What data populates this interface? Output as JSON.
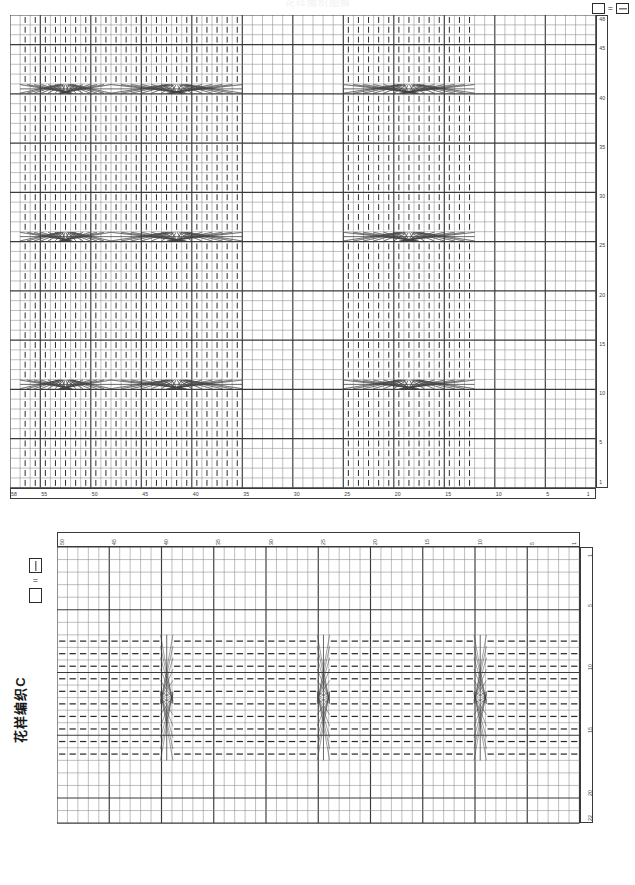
{
  "page": {
    "top_title": "花样编织图解"
  },
  "legend_a": {
    "name": "chart-a-legend",
    "empty_symbol": "square-empty",
    "equals": "=",
    "filled_symbol": "square-with-horizontal-dash"
  },
  "legend_b": {
    "name": "chart-b-legend",
    "bar_symbol": "square-with-vertical-bar",
    "equals": "=",
    "empty_symbol": "square-empty"
  },
  "chart_b_caption": "花样编织C",
  "chart_a": {
    "name": "pattern-chart-a",
    "cols": 58,
    "rows": 48,
    "cell_w": 10.1,
    "cell_h": 9.85,
    "origin_x": 10,
    "origin_y": 15,
    "heavy_every": 5,
    "direction": "right-to-left",
    "bottom_ticks": [
      {
        "label": "58",
        "col": 58
      },
      {
        "label": "55",
        "col": 55
      },
      {
        "label": "50",
        "col": 50
      },
      {
        "label": "45",
        "col": 45
      },
      {
        "label": "40",
        "col": 40
      },
      {
        "label": "35",
        "col": 35
      },
      {
        "label": "30",
        "col": 30
      },
      {
        "label": "25",
        "col": 25
      },
      {
        "label": "20",
        "col": 20
      },
      {
        "label": "15",
        "col": 15
      },
      {
        "label": "10",
        "col": 10
      },
      {
        "label": "5",
        "col": 5
      },
      {
        "label": "1",
        "col": 1
      }
    ],
    "right_ticks": [
      {
        "label": "48",
        "row": 48
      },
      {
        "label": "45",
        "row": 45
      },
      {
        "label": "40",
        "row": 40
      },
      {
        "label": "35",
        "row": 35
      },
      {
        "label": "30",
        "row": 30
      },
      {
        "label": "25",
        "row": 25
      },
      {
        "label": "20",
        "row": 20
      },
      {
        "label": "15",
        "row": 15
      },
      {
        "label": "10",
        "row": 10
      },
      {
        "label": "5",
        "row": 5
      },
      {
        "label": "1",
        "row": 1
      }
    ],
    "knit_column_bands": [
      {
        "start_col": 36,
        "end_col": 48
      },
      {
        "start_col": 13,
        "end_col": 25
      },
      {
        "start_col": 49,
        "end_col": 57
      }
    ],
    "cable_crossings": [
      {
        "row": 41,
        "start_col": 36,
        "end_col": 48
      },
      {
        "row": 41,
        "start_col": 13,
        "end_col": 25
      },
      {
        "row": 41,
        "start_col": 49,
        "end_col": 57
      },
      {
        "row": 26,
        "start_col": 36,
        "end_col": 48
      },
      {
        "row": 26,
        "start_col": 13,
        "end_col": 25
      },
      {
        "row": 26,
        "start_col": 49,
        "end_col": 57
      },
      {
        "row": 11,
        "start_col": 36,
        "end_col": 48
      },
      {
        "row": 11,
        "start_col": 13,
        "end_col": 25
      },
      {
        "row": 11,
        "start_col": 49,
        "end_col": 57
      }
    ]
  },
  "chart_b": {
    "name": "pattern-chart-b",
    "cols": 50,
    "rows": 22,
    "cell_w": 10.45,
    "cell_h": 12.55,
    "origin_x": 57,
    "origin_y": 547,
    "heavy_every": 5,
    "direction": "right-to-left",
    "top_ticks": [
      {
        "label": "50",
        "col": 50
      },
      {
        "label": "45",
        "col": 45
      },
      {
        "label": "40",
        "col": 40
      },
      {
        "label": "35",
        "col": 35
      },
      {
        "label": "30",
        "col": 30
      },
      {
        "label": "25",
        "col": 25
      },
      {
        "label": "20",
        "col": 20
      },
      {
        "label": "15",
        "col": 15
      },
      {
        "label": "10",
        "col": 10
      },
      {
        "label": "5",
        "col": 5
      },
      {
        "label": "1",
        "col": 1
      }
    ],
    "right_ticks": [
      {
        "label": "1",
        "row": 1
      },
      {
        "label": "5",
        "row": 5
      },
      {
        "label": "10",
        "row": 10
      },
      {
        "label": "15",
        "row": 15
      },
      {
        "label": "20",
        "row": 20
      },
      {
        "label": "22",
        "row": 22
      }
    ],
    "purl_row_bands": [
      {
        "start_row": 8,
        "end_row": 17
      }
    ],
    "cable_crossings": [
      {
        "col": 10,
        "start_row": 8,
        "end_row": 17
      },
      {
        "col": 25,
        "start_row": 8,
        "end_row": 17
      },
      {
        "col": 40,
        "start_row": 8,
        "end_row": 17
      }
    ]
  },
  "colors": {
    "grid_light": "#8a8a8a",
    "grid_heavy": "#3a3a3a",
    "symbol": "#2b2b2b",
    "cable": "#444444",
    "background": "#ffffff"
  }
}
